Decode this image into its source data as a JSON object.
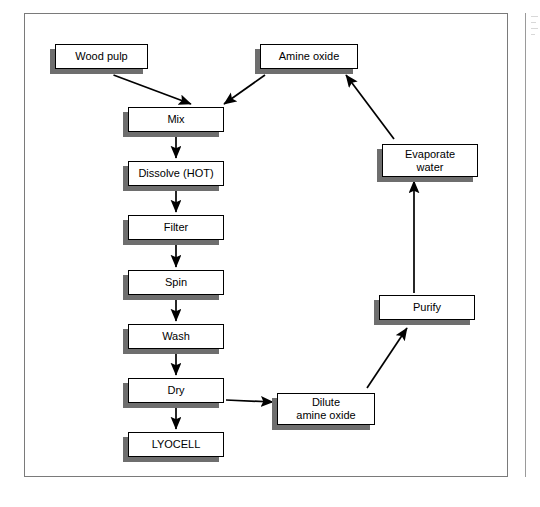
{
  "figure": {
    "type": "process-flow-diagram"
  },
  "nodes": [
    {
      "id": "wood-pulp",
      "label": "Wood pulp",
      "x": 55,
      "y": 44,
      "w": 93,
      "h": 25
    },
    {
      "id": "amine-oxide",
      "label": "Amine oxide",
      "x": 260,
      "y": 44,
      "w": 98,
      "h": 25
    },
    {
      "id": "mix",
      "label": "Mix",
      "x": 128,
      "y": 107,
      "w": 96,
      "h": 25
    },
    {
      "id": "dissolve",
      "label": "Dissolve (HOT)",
      "x": 128,
      "y": 161,
      "w": 96,
      "h": 25
    },
    {
      "id": "filter",
      "label": "Filter",
      "x": 128,
      "y": 215,
      "w": 96,
      "h": 25
    },
    {
      "id": "spin",
      "label": "Spin",
      "x": 128,
      "y": 270,
      "w": 96,
      "h": 25
    },
    {
      "id": "wash",
      "label": "Wash",
      "x": 128,
      "y": 324,
      "w": 96,
      "h": 25
    },
    {
      "id": "dry",
      "label": "Dry",
      "x": 128,
      "y": 378,
      "w": 96,
      "h": 25
    },
    {
      "id": "lyocell",
      "label": "LYOCELL",
      "x": 128,
      "y": 432,
      "w": 96,
      "h": 25
    },
    {
      "id": "dilute",
      "label": "Dilute\namine oxide",
      "x": 277,
      "y": 393,
      "w": 98,
      "h": 32
    },
    {
      "id": "purify",
      "label": "Purify",
      "x": 379,
      "y": 295,
      "w": 96,
      "h": 25
    },
    {
      "id": "evaporate",
      "label": "Evaporate\nwater",
      "x": 382,
      "y": 144,
      "w": 96,
      "h": 33
    }
  ],
  "edges": [
    {
      "id": "wood-pulp-to-mix",
      "from": "wood-pulp",
      "to": "mix",
      "style": "diagonal"
    },
    {
      "id": "amine-oxide-to-mix",
      "from": "amine-oxide",
      "to": "mix",
      "style": "diagonal"
    },
    {
      "id": "mix-to-dissolve",
      "from": "mix",
      "to": "dissolve",
      "style": "vertical"
    },
    {
      "id": "dissolve-to-filter",
      "from": "dissolve",
      "to": "filter",
      "style": "vertical"
    },
    {
      "id": "filter-to-spin",
      "from": "filter",
      "to": "spin",
      "style": "vertical"
    },
    {
      "id": "spin-to-wash",
      "from": "spin",
      "to": "wash",
      "style": "vertical"
    },
    {
      "id": "wash-to-dry",
      "from": "wash",
      "to": "dry",
      "style": "vertical"
    },
    {
      "id": "dry-to-lyocell",
      "from": "dry",
      "to": "lyocell",
      "style": "vertical"
    },
    {
      "id": "dry-to-dilute",
      "from": "dry",
      "to": "dilute",
      "style": "diagonal"
    },
    {
      "id": "dilute-to-purify",
      "from": "dilute",
      "to": "purify",
      "style": "diagonal"
    },
    {
      "id": "purify-to-evaporate",
      "from": "purify",
      "to": "evaporate",
      "style": "vertical"
    },
    {
      "id": "evaporate-to-amine-oxide",
      "from": "evaporate",
      "to": "amine-oxide",
      "style": "diagonal"
    }
  ],
  "colors": {
    "node_fill": "#ffffff",
    "node_border": "#000000",
    "node_shadow": "#6e6e6e",
    "connector": "#000000",
    "frame": "#7a7a7a",
    "page_background": "#ffffff"
  }
}
